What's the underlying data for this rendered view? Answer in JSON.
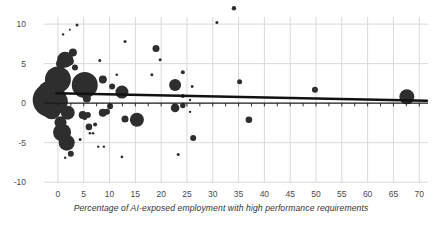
{
  "chart_data": {
    "type": "scatter",
    "title": "",
    "xlabel": "Percentage of AI-exposed employment with high performance requirements",
    "ylabel": "",
    "xlim": [
      -2.7,
      71.7
    ],
    "ylim": [
      -10.1,
      10.9
    ],
    "x_ticks": [
      0,
      5,
      10,
      15,
      20,
      25,
      30,
      35,
      40,
      45,
      50,
      55,
      60,
      65,
      70
    ],
    "y_ticks": [
      10,
      5,
      0,
      -5,
      -10
    ],
    "zero_axis_minor_tick_step": 2.5,
    "grid": true,
    "legend": "none",
    "trend_line": {
      "x1": -0.3,
      "y1": 1.25,
      "x2": 71.5,
      "y2": 0.3
    },
    "points": [
      {
        "x": 3.7,
        "y": 9.9,
        "r": 1.5
      },
      {
        "x": 1.0,
        "y": 8.7,
        "r": 1.2
      },
      {
        "x": 2.3,
        "y": 9.3,
        "r": 1.0
      },
      {
        "x": 13.0,
        "y": 7.8,
        "r": 1.5
      },
      {
        "x": 34.1,
        "y": 12.0,
        "r": 2.2
      },
      {
        "x": 30.8,
        "y": 10.2,
        "r": 1.5
      },
      {
        "x": 19.0,
        "y": 6.9,
        "r": 3.5
      },
      {
        "x": 19.8,
        "y": 5.5,
        "r": 1.5
      },
      {
        "x": 8.1,
        "y": 5.4,
        "r": 1.5
      },
      {
        "x": 2.9,
        "y": 6.4,
        "r": 4.0
      },
      {
        "x": 1.4,
        "y": 5.5,
        "r": 8.0
      },
      {
        "x": 0.6,
        "y": 5.0,
        "r": 5.0
      },
      {
        "x": 2.3,
        "y": 5.3,
        "r": 4.0
      },
      {
        "x": 3.3,
        "y": 4.5,
        "r": 3.0
      },
      {
        "x": 11.4,
        "y": 3.6,
        "r": 1.3
      },
      {
        "x": 0.0,
        "y": 3.0,
        "r": 13.0
      },
      {
        "x": 5.2,
        "y": 2.3,
        "r": 13.0
      },
      {
        "x": -1.9,
        "y": 1.5,
        "r": 10.0
      },
      {
        "x": -1.6,
        "y": 0.4,
        "r": 17.0
      },
      {
        "x": -1.2,
        "y": -0.9,
        "r": 9.0
      },
      {
        "x": 0.0,
        "y": 0.2,
        "r": 10.0
      },
      {
        "x": 8.7,
        "y": 3.0,
        "r": 4.0
      },
      {
        "x": 10.5,
        "y": 2.1,
        "r": 3.0
      },
      {
        "x": 18.2,
        "y": 3.6,
        "r": 1.5
      },
      {
        "x": 22.7,
        "y": 2.3,
        "r": 6.0
      },
      {
        "x": 24.2,
        "y": 3.9,
        "r": 2.0
      },
      {
        "x": 26.0,
        "y": 2.1,
        "r": 1.2
      },
      {
        "x": 35.2,
        "y": 2.7,
        "r": 2.5
      },
      {
        "x": 12.4,
        "y": 1.4,
        "r": 6.5
      },
      {
        "x": 5.6,
        "y": 0.6,
        "r": 4.0
      },
      {
        "x": 24.2,
        "y": 0.9,
        "r": 2.0
      },
      {
        "x": 25.6,
        "y": 0.4,
        "r": 1.2
      },
      {
        "x": 49.8,
        "y": 1.7,
        "r": 3.0
      },
      {
        "x": 67.6,
        "y": 0.8,
        "r": 7.5
      },
      {
        "x": 10.1,
        "y": -0.4,
        "r": 3.0
      },
      {
        "x": 1.9,
        "y": -1.2,
        "r": 7.0
      },
      {
        "x": 4.8,
        "y": -1.5,
        "r": 4.0
      },
      {
        "x": 5.8,
        "y": -1.5,
        "r": 3.0
      },
      {
        "x": 8.7,
        "y": -1.2,
        "r": 4.0
      },
      {
        "x": 9.5,
        "y": -1.1,
        "r": 3.0
      },
      {
        "x": 5.2,
        "y": -1.8,
        "r": 2.5
      },
      {
        "x": 13.0,
        "y": -2.0,
        "r": 3.5
      },
      {
        "x": 15.3,
        "y": -2.1,
        "r": 7.0
      },
      {
        "x": 22.7,
        "y": -0.6,
        "r": 4.3
      },
      {
        "x": 24.2,
        "y": -0.3,
        "r": 2.7
      },
      {
        "x": 25.6,
        "y": -1.1,
        "r": 1.2
      },
      {
        "x": 37.0,
        "y": -2.1,
        "r": 3.3
      },
      {
        "x": 6.0,
        "y": -3.0,
        "r": 3.3
      },
      {
        "x": 7.2,
        "y": -2.7,
        "r": 2.0
      },
      {
        "x": 0.5,
        "y": -2.4,
        "r": 6.0
      },
      {
        "x": 0.8,
        "y": -3.7,
        "r": 9.0
      },
      {
        "x": 1.7,
        "y": -5.0,
        "r": 8.0
      },
      {
        "x": 2.5,
        "y": -6.4,
        "r": 3.0
      },
      {
        "x": 4.3,
        "y": -4.6,
        "r": 1.5
      },
      {
        "x": 6.2,
        "y": -3.8,
        "r": 1.3
      },
      {
        "x": 6.8,
        "y": -3.8,
        "r": 1.3
      },
      {
        "x": 26.2,
        "y": -4.4,
        "r": 3.0
      },
      {
        "x": 12.4,
        "y": -6.8,
        "r": 1.3
      },
      {
        "x": 23.3,
        "y": -6.5,
        "r": 1.5
      },
      {
        "x": 7.8,
        "y": -5.5,
        "r": 1.2
      },
      {
        "x": 8.9,
        "y": -5.5,
        "r": 1.2
      },
      {
        "x": 1.4,
        "y": -6.9,
        "r": 1.2
      },
      {
        "x": 26.0,
        "y": 2.1,
        "r": 1.2
      }
    ],
    "colors": {
      "bubble": "#2e2e2e",
      "grid": "#d9d9d9",
      "axis": "#1a1a1a",
      "trend": "#111111",
      "tick_label": "#4a4a4a",
      "title": "#333333",
      "background": "#ffffff"
    }
  }
}
